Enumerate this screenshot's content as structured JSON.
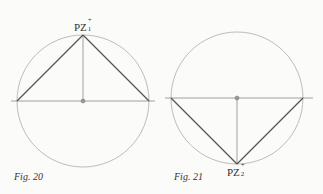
{
  "figures": [
    {
      "caption": "Fig. 20",
      "point_label": "PZ",
      "point_sup": "+",
      "point_sub": "1",
      "apex": "top"
    },
    {
      "caption": "Fig. 21",
      "point_label": "PZ",
      "point_sup": "+",
      "point_sub": "2",
      "apex": "bottom"
    }
  ],
  "colors": {
    "circle": "#b8b8b8",
    "triangle": "#555555",
    "axis": "#9a9a9a",
    "center_dot": "#888888"
  }
}
